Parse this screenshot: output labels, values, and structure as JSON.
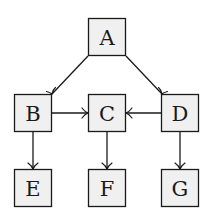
{
  "diagram": {
    "type": "directed-graph",
    "node_size": 37,
    "colors": {
      "fill": "#f0f0f0",
      "stroke": "#1a1a1a",
      "background": "#ffffff"
    },
    "nodes": [
      {
        "id": "A",
        "label": "A",
        "x": 107,
        "y": 37
      },
      {
        "id": "B",
        "label": "B",
        "x": 33,
        "y": 113
      },
      {
        "id": "C",
        "label": "C",
        "x": 107,
        "y": 113
      },
      {
        "id": "D",
        "label": "D",
        "x": 180,
        "y": 113
      },
      {
        "id": "E",
        "label": "E",
        "x": 33,
        "y": 188
      },
      {
        "id": "F",
        "label": "F",
        "x": 107,
        "y": 188
      },
      {
        "id": "G",
        "label": "G",
        "x": 180,
        "y": 188
      }
    ],
    "edges": [
      {
        "from": "A",
        "to": "B"
      },
      {
        "from": "A",
        "to": "D"
      },
      {
        "from": "B",
        "to": "C"
      },
      {
        "from": "D",
        "to": "C"
      },
      {
        "from": "B",
        "to": "E"
      },
      {
        "from": "C",
        "to": "F"
      },
      {
        "from": "D",
        "to": "G"
      }
    ]
  }
}
